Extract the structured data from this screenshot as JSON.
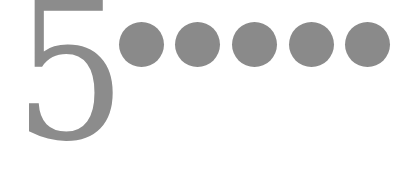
{
  "rating": {
    "numeral": "5",
    "dots_count": 5,
    "color": "#8a8a8a",
    "dots": [
      {
        "cx": 141,
        "cy": 44
      },
      {
        "cx": 197,
        "cy": 44
      },
      {
        "cx": 254,
        "cy": 44
      },
      {
        "cx": 311,
        "cy": 44
      },
      {
        "cx": 367,
        "cy": 44
      }
    ]
  }
}
